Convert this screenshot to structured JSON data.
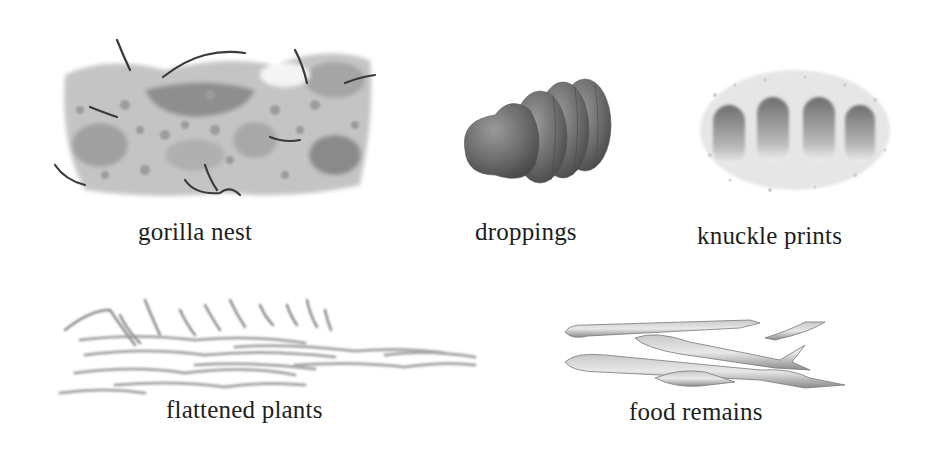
{
  "figure": {
    "background": "#ffffff",
    "ink_color": "#1e1e1e",
    "items": [
      {
        "id": "gorilla-nest",
        "label": "gorilla nest",
        "tone": "#8a8a8a"
      },
      {
        "id": "droppings",
        "label": "droppings",
        "tone": "#6e6e6e"
      },
      {
        "id": "knuckle-prints",
        "label": "knuckle prints",
        "tone": "#7a7a7a"
      },
      {
        "id": "flattened-plants",
        "label": "flattened plants",
        "tone": "#9a9a9a"
      },
      {
        "id": "food-remains",
        "label": "food remains",
        "tone": "#a0a0a0"
      }
    ]
  }
}
